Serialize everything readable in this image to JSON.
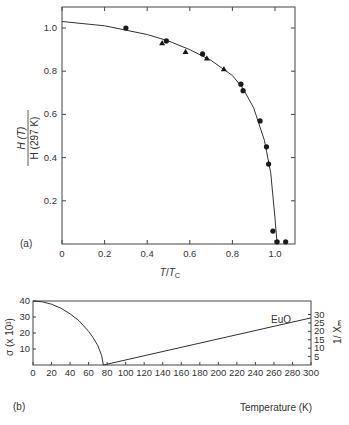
{
  "chart_data": [
    {
      "panel": "(a)",
      "type": "scatter",
      "title": "",
      "xlabel": "T/T_C",
      "ylabel": "H(T) / H(297 K)",
      "xlim": [
        0,
        1.1
      ],
      "ylim": [
        0,
        1.1
      ],
      "grid": false,
      "x_ticks": [
        "0",
        "0.2",
        "0.4",
        "0.6",
        "0.8",
        "1.0"
      ],
      "y_ticks": [
        "0.2",
        "0.4",
        "0.6",
        "0.8",
        "1.0"
      ],
      "series": [
        {
          "name": "circles",
          "marker": "circle",
          "x": [
            0.3,
            0.49,
            0.66,
            0.84,
            0.85,
            0.93,
            0.96,
            0.97,
            0.99,
            1.01,
            1.05
          ],
          "y": [
            1.0,
            0.94,
            0.88,
            0.74,
            0.71,
            0.57,
            0.45,
            0.37,
            0.06,
            0.01,
            0.01
          ]
        },
        {
          "name": "triangles",
          "marker": "triangle",
          "x": [
            0.47,
            0.58,
            0.68,
            0.76
          ],
          "y": [
            0.93,
            0.89,
            0.86,
            0.81
          ]
        },
        {
          "name": "fit curve",
          "marker": "line",
          "x": [
            0,
            0.2,
            0.4,
            0.5,
            0.6,
            0.7,
            0.8,
            0.85,
            0.9,
            0.95,
            0.98,
            1.0,
            1.01
          ],
          "y": [
            1.03,
            1.01,
            0.97,
            0.94,
            0.9,
            0.85,
            0.78,
            0.72,
            0.63,
            0.48,
            0.33,
            0.12,
            0.0
          ]
        }
      ],
      "panel_label": "(a)"
    },
    {
      "panel": "(b)",
      "type": "line",
      "title": "",
      "xlabel": "Temperature (K)",
      "ylabel_left": "σ (x 10³)",
      "ylabel_right": "1/X_m",
      "xlim": [
        0,
        300
      ],
      "ylim_left": [
        0,
        40
      ],
      "ylim_right": [
        0,
        35
      ],
      "grid": false,
      "x_ticks": [
        "0",
        "20",
        "40",
        "60",
        "80",
        "100",
        "120",
        "140",
        "160",
        "180",
        "200",
        "220",
        "240",
        "260",
        "280",
        "300"
      ],
      "y_ticks_left": [
        "10",
        "20",
        "30",
        "40"
      ],
      "y_ticks_right": [
        "5",
        "10",
        "15",
        "20",
        "25",
        "30"
      ],
      "annotation": "EuO",
      "series": [
        {
          "name": "σ (magnetization)",
          "axis": "left",
          "x": [
            0,
            10,
            20,
            30,
            40,
            50,
            60,
            65,
            70,
            74,
            76
          ],
          "y": [
            40,
            39.5,
            38,
            35.5,
            32,
            27.5,
            21,
            17,
            12,
            6,
            0
          ]
        },
        {
          "name": "1/X_m (inverse susceptibility)",
          "axis": "right",
          "x": [
            76,
            300
          ],
          "y": [
            0,
            28
          ]
        }
      ],
      "panel_label": "(b)"
    }
  ],
  "labels": {
    "a_panel": "(a)",
    "b_panel": "(b)",
    "a_ylabel_num": "H (T)",
    "a_ylabel_den": "H (297 K)",
    "a_xlabel_T": "T",
    "a_xlabel_slash": "/",
    "a_xlabel_Tc": "T",
    "a_xlabel_sub": "C",
    "b_xlabel": "Temperature (K)",
    "b_ylabel_left": "σ (x 10³)",
    "b_ylabel_right": "1/ Xₘ",
    "b_annotation": "EuO"
  },
  "ticks": {
    "a_x": [
      "0",
      "0.2",
      "0.4",
      "0.6",
      "0.8",
      "1.0"
    ],
    "a_y": [
      "0.2",
      "0.4",
      "0.6",
      "0.8",
      "1.0"
    ],
    "b_x": [
      "0",
      "20",
      "40",
      "60",
      "80",
      "100",
      "120",
      "140",
      "160",
      "180",
      "200",
      "220",
      "240",
      "260",
      "280",
      "300"
    ],
    "b_y_left": [
      "10",
      "20",
      "30",
      "40"
    ],
    "b_y_right": [
      "5",
      "10",
      "15",
      "20",
      "25",
      "30"
    ]
  }
}
